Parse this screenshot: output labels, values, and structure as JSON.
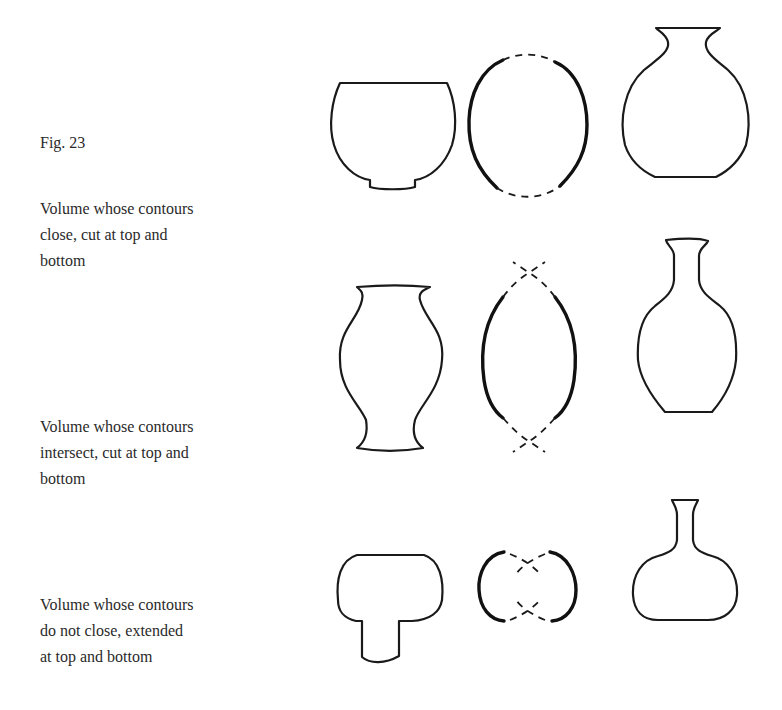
{
  "figure": {
    "label": "Fig. 23",
    "rows": [
      {
        "caption_lines": [
          "Volume whose contours",
          "close, cut at top and",
          "bottom"
        ],
        "drawings": [
          "bowl-cut-vessel",
          "closed-contour-diagram",
          "globular-vase"
        ]
      },
      {
        "caption_lines": [
          "Volume whose contours",
          "intersect, cut at top and",
          "bottom"
        ],
        "drawings": [
          "baluster-vase",
          "intersecting-contour-diagram",
          "ovoid-bottle-vase"
        ]
      },
      {
        "caption_lines": [
          "Volume whose contours",
          "do not close, extended",
          "at top and bottom"
        ],
        "drawings": [
          "mushroom-vessel",
          "open-contour-diagram",
          "flask-bottle"
        ]
      }
    ]
  },
  "colors": {
    "background": "#ffffff",
    "line": "#1a1a1a",
    "text": "#2a2a2a"
  }
}
